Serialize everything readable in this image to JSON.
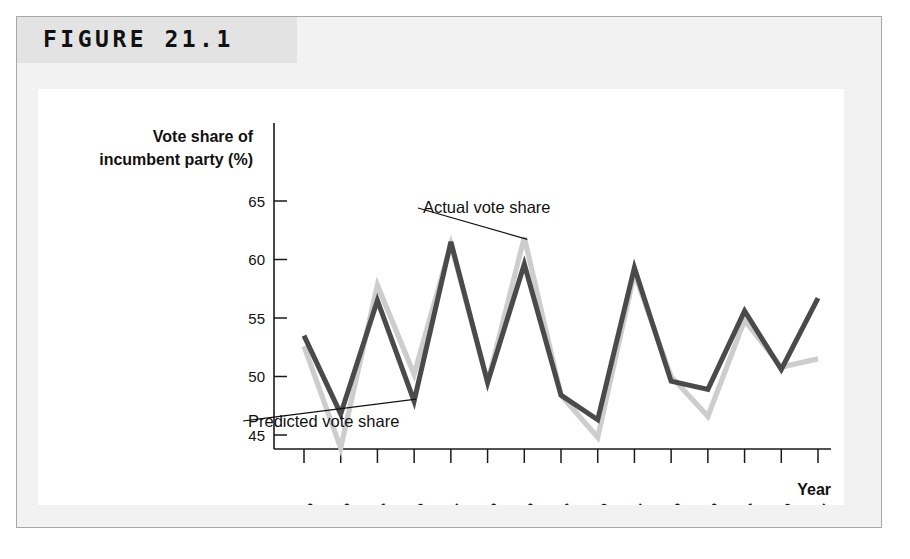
{
  "figure": {
    "label": "FIGURE 21.1"
  },
  "chart_data": {
    "type": "line",
    "title": "",
    "xlabel": "Year",
    "ylabel": "Vote share of incumbent party (%)",
    "ylabel_line1": "Vote share of",
    "ylabel_line2": "incumbent party (%)",
    "grid": false,
    "legend_position": "inline-annotations",
    "xlim": [
      1946,
      2006
    ],
    "ylim": [
      42,
      67
    ],
    "yticks": [
      45,
      50,
      55,
      60,
      65
    ],
    "ytick_labels": [
      "45",
      "50",
      "55",
      "60",
      "65"
    ],
    "categories": [
      1948,
      1952,
      1956,
      1960,
      1964,
      1968,
      1972,
      1976,
      1980,
      1984,
      1988,
      1992,
      1996,
      2000,
      2004
    ],
    "xtick_labels": [
      "1948",
      "1952",
      "1956",
      "1960",
      "1964",
      "1968",
      "1972",
      "1976",
      "1980",
      "1984",
      "1988",
      "1992",
      "1996",
      "2000",
      "2004"
    ],
    "series": [
      {
        "name": "Actual vote share",
        "color": "#cdcdcd",
        "values": [
          52.6,
          43.9,
          57.8,
          50.2,
          61.3,
          49.5,
          61.9,
          48.4,
          44.8,
          58.8,
          50.0,
          46.6,
          54.8,
          50.8,
          51.5
        ]
      },
      {
        "name": "Predicted vote share",
        "color": "#4a4a4a",
        "values": [
          53.5,
          46.8,
          56.5,
          47.9,
          61.5,
          49.5,
          59.6,
          48.4,
          46.3,
          59.3,
          49.6,
          48.9,
          55.6,
          50.6,
          56.7
        ]
      }
    ],
    "annotations": [
      {
        "text": "Actual vote share",
        "points_to_year": 1972,
        "points_to_series": "Actual vote share"
      },
      {
        "text": "Predicted vote share",
        "points_to_year": 1960,
        "points_to_series": "Predicted vote share"
      }
    ]
  }
}
